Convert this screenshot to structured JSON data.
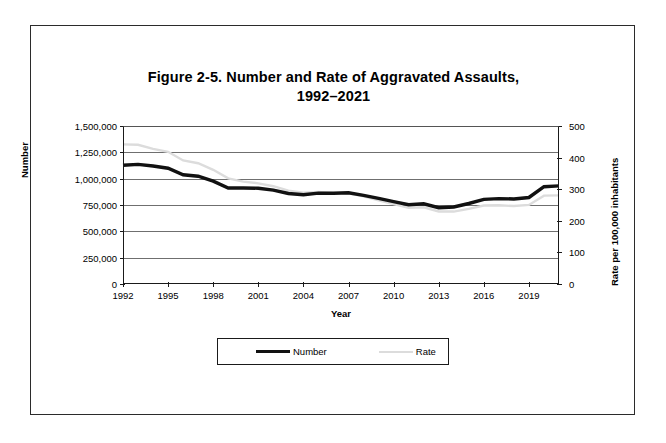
{
  "figure": {
    "title_line1": "Figure 2-5. Number and Rate of Aggravated Assaults,",
    "title_line2": "1992–2021"
  },
  "axes": {
    "xlabel": "Year",
    "ylabel_left": "Number",
    "ylabel_right": "Rate per 100,000 inhabitants",
    "yticks_left": [
      "0",
      "250,000",
      "500,000",
      "750,000",
      "1,000,000",
      "1,250,000",
      "1,500,000"
    ],
    "yticks_right": [
      "0",
      "100",
      "200",
      "300",
      "400",
      "500"
    ],
    "xticks": [
      "1992",
      "1995",
      "1998",
      "2001",
      "2004",
      "2007",
      "2010",
      "2013",
      "2016",
      "2019"
    ]
  },
  "legend": {
    "items": [
      {
        "label": "Number",
        "color": "#111111"
      },
      {
        "label": "Rate",
        "color": "#dcdcdc"
      }
    ]
  },
  "chart_data": {
    "type": "line",
    "title": "Figure 2-5. Number and Rate of Aggravated Assaults, 1992–2021",
    "xlabel": "Year",
    "ylabel": "Number",
    "ylabel_secondary": "Rate per 100,000 inhabitants",
    "grid": true,
    "legend_position": "bottom",
    "xlim": [
      1992,
      2021
    ],
    "ylim": [
      0,
      1500000
    ],
    "ylim_secondary": [
      0,
      500
    ],
    "x": [
      1992,
      1993,
      1994,
      1995,
      1996,
      1997,
      1998,
      1999,
      2000,
      2001,
      2002,
      2003,
      2004,
      2005,
      2006,
      2007,
      2008,
      2009,
      2010,
      2011,
      2012,
      2013,
      2014,
      2015,
      2016,
      2017,
      2018,
      2019,
      2020,
      2021
    ],
    "series": [
      {
        "name": "Number",
        "axis": "left",
        "color": "#111111",
        "values": [
          1126970,
          1135607,
          1119950,
          1099207,
          1037470,
          1023201,
          976583,
          911740,
          911706,
          909023,
          891407,
          859030,
          847381,
          862220,
          860853,
          866358,
          842134,
          812514,
          781844,
          752423,
          762009,
          724149,
          731089,
          764449,
          803007,
          810825,
          807410,
          821182,
          923715,
          931193
        ]
      },
      {
        "name": "Rate",
        "axis": "right",
        "color": "#dcdcdc",
        "values": [
          441.8,
          440.5,
          427.6,
          418.3,
          391.0,
          382.1,
          361.4,
          334.3,
          324.0,
          318.6,
          309.5,
          295.4,
          288.6,
          291.1,
          287.5,
          287.2,
          277.5,
          264.7,
          252.8,
          241.5,
          242.8,
          229.6,
          229.2,
          237.8,
          248.5,
          249.0,
          246.8,
          250.2,
          279.7,
          280.5
        ]
      }
    ]
  }
}
